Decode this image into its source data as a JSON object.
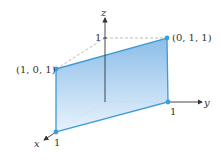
{
  "axes": {
    "x_label": "x",
    "y_label": "y",
    "z_label": "z",
    "x_tick": "1",
    "y_tick": "1",
    "z_tick": "1"
  },
  "points": {
    "p1": "(1, 0, 1)",
    "p2": "(0, 1, 1)"
  },
  "colors": {
    "plane_fill_top": "#7fb6e6",
    "plane_fill_bottom": "#e3f0fb",
    "plane_edge": "#3d9bd6",
    "vertex": "#3aa0d8",
    "axis": "#333333",
    "dashed": "#aaaaaa"
  }
}
